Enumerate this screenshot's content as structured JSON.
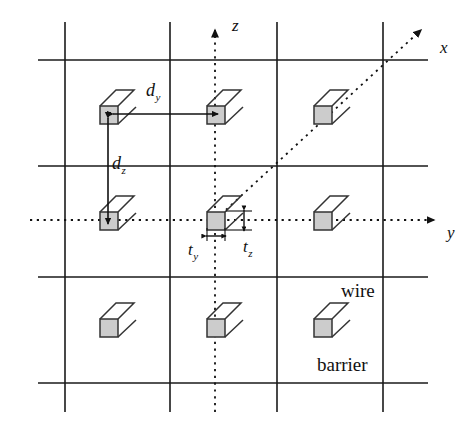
{
  "figure": {
    "background_color": "#ffffff",
    "line_color": "#1a1a1a",
    "wire_fill_color": "#cccccc",
    "wire_stroke_color": "#333333"
  },
  "axes": [
    {
      "id": "z",
      "label": "z",
      "style": "dotted",
      "direction": "up",
      "arrowhead": "solid-triangle",
      "label_x": 232,
      "label_y": 26
    },
    {
      "id": "y",
      "label": "y",
      "style": "dotted",
      "direction": "right",
      "arrowhead": "solid-triangle",
      "label_x": 452,
      "label_y": 232
    },
    {
      "id": "x",
      "label": "x",
      "style": "dotted",
      "direction": "up-right-diagonal",
      "arrowhead": "solid-triangle",
      "label_x": 445,
      "label_y": 48
    }
  ],
  "dimensions": [
    {
      "id": "dy",
      "base": "d",
      "subscript": "y",
      "meaning": "wire pitch along y",
      "arrow": "double-headed-horizontal",
      "label_x": 152,
      "label_y": 92
    },
    {
      "id": "dz",
      "base": "d",
      "subscript": "z",
      "meaning": "wire pitch along z",
      "arrow": "double-headed-vertical",
      "label_x": 116,
      "label_y": 165
    },
    {
      "id": "ty",
      "base": "t",
      "subscript": "y",
      "meaning": "wire thickness along y",
      "arrow": "double-headed-horizontal",
      "label_x": 193,
      "label_y": 251
    },
    {
      "id": "tz",
      "base": "t",
      "subscript": "z",
      "meaning": "wire thickness along z",
      "arrow": "double-headed-vertical",
      "label_x": 248,
      "label_y": 250
    }
  ],
  "annotations": [
    {
      "id": "wire",
      "text": "wire",
      "x": 341,
      "y": 294
    },
    {
      "id": "barrier",
      "text": "barrier",
      "x": 348,
      "y": 368
    }
  ],
  "grid": {
    "x_lines": [
      65,
      170,
      277,
      383
    ],
    "y_lines": [
      60,
      166,
      277,
      383
    ],
    "frame": {
      "left": 38,
      "right": 428,
      "top": 22,
      "bottom": 412
    }
  },
  "wires": [
    {
      "row": 0,
      "col": 0,
      "cx": 108,
      "cy": 114,
      "highlighted": true
    },
    {
      "row": 0,
      "col": 1,
      "cx": 215,
      "cy": 114,
      "highlighted": true
    },
    {
      "row": 0,
      "col": 2,
      "cx": 322,
      "cy": 114,
      "highlighted": false
    },
    {
      "row": 1,
      "col": 0,
      "cx": 108,
      "cy": 220,
      "highlighted": true
    },
    {
      "row": 1,
      "col": 1,
      "cx": 215,
      "cy": 220,
      "highlighted": false
    },
    {
      "row": 1,
      "col": 2,
      "cx": 322,
      "cy": 220,
      "highlighted": false
    },
    {
      "row": 2,
      "col": 0,
      "cx": 108,
      "cy": 327,
      "highlighted": false
    },
    {
      "row": 2,
      "col": 1,
      "cx": 215,
      "cy": 327,
      "highlighted": false
    },
    {
      "row": 2,
      "col": 2,
      "cx": 322,
      "cy": 327,
      "highlighted": false
    }
  ]
}
